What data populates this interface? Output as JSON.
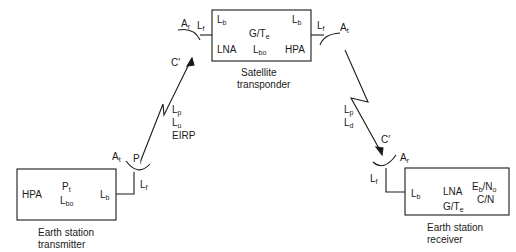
{
  "diagram": {
    "earth_tx": {
      "caption_line1": "Earth station",
      "caption_line2": "transmitter",
      "hpa": "HPA",
      "pt": {
        "base": "P",
        "sub": "t"
      },
      "lbo": {
        "base": "L",
        "sub": "bo"
      },
      "lb": {
        "base": "L",
        "sub": "b"
      },
      "lf": {
        "base": "L",
        "sub": "f"
      },
      "at": {
        "base": "A",
        "sub": "t"
      },
      "pr": {
        "base": "P",
        "sub": "r"
      }
    },
    "uplink": {
      "lp": {
        "base": "L",
        "sub": "p"
      },
      "lu": {
        "base": "L",
        "sub": "u"
      },
      "eirp": "EIRP",
      "c_prime": "C′"
    },
    "satellite": {
      "caption_line1": "Satellite",
      "caption_line2": "transponder",
      "ar": {
        "base": "A",
        "sub": "r"
      },
      "lf_in": {
        "base": "L",
        "sub": "f"
      },
      "lb_in": {
        "base": "L",
        "sub": "b"
      },
      "lb_out": {
        "base": "L",
        "sub": "b"
      },
      "g_te": {
        "base": "G/T",
        "sub": "e"
      },
      "lna": "LNA",
      "lbo": {
        "base": "L",
        "sub": "bo"
      },
      "hpa": "HPA",
      "lf_out": {
        "base": "L",
        "sub": "f"
      },
      "at": {
        "base": "A",
        "sub": "t"
      }
    },
    "downlink": {
      "lp": {
        "base": "L",
        "sub": "p"
      },
      "ld": {
        "base": "L",
        "sub": "d"
      },
      "c_prime": "C′"
    },
    "earth_rx": {
      "caption_line1": "Earth station",
      "caption_line2": "receiver",
      "ar": {
        "base": "A",
        "sub": "r"
      },
      "lf": {
        "base": "L",
        "sub": "f"
      },
      "lb": {
        "base": "L",
        "sub": "b"
      },
      "lna": "LNA",
      "g_te": {
        "base": "G/T",
        "sub": "e"
      },
      "eb_no": {
        "base1": "E",
        "sub1": "b",
        "mid": "/N",
        "sub2": "o"
      },
      "cn": "C/N"
    },
    "colors": {
      "line": "#1a1a1a",
      "background": "#ffffff"
    }
  }
}
